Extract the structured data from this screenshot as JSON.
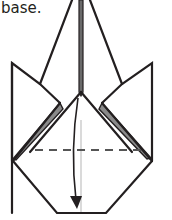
{
  "caption": "base.",
  "diagram": {
    "elements": [
      "center-spine",
      "left-flap",
      "right-flap",
      "body-outline",
      "valley-fold-line",
      "fold-arrow"
    ],
    "fold_type": "valley fold",
    "arrow_direction": "down",
    "colors": {
      "line": "#231f20",
      "shade": "#8a8a8a",
      "crease": "#b5b5b5",
      "dash": "#555555"
    }
  }
}
